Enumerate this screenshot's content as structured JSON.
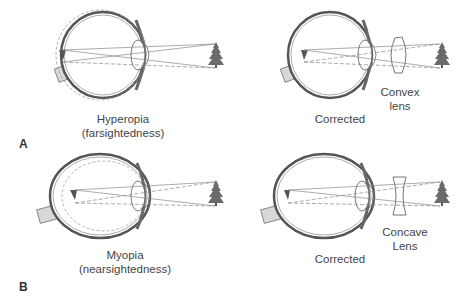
{
  "panels": [
    {
      "letter": "A",
      "left": {
        "caption_line1": "Hyperopia",
        "caption_line2": "(farsightedness)"
      },
      "right": {
        "caption": "Corrected",
        "lens_line1": "Convex",
        "lens_line2": "lens",
        "lens_type": "convex"
      }
    },
    {
      "letter": "B",
      "left": {
        "caption_line1": "Myopia",
        "caption_line2": "(nearsightedness)"
      },
      "right": {
        "caption": "Corrected",
        "lens_line1": "Concave",
        "lens_line2": "Lens",
        "lens_type": "concave"
      }
    }
  ],
  "colors": {
    "outline": "#555555",
    "ray": "#888888",
    "tree": "#6a6a6a",
    "nerve": "#d8d8d8"
  }
}
